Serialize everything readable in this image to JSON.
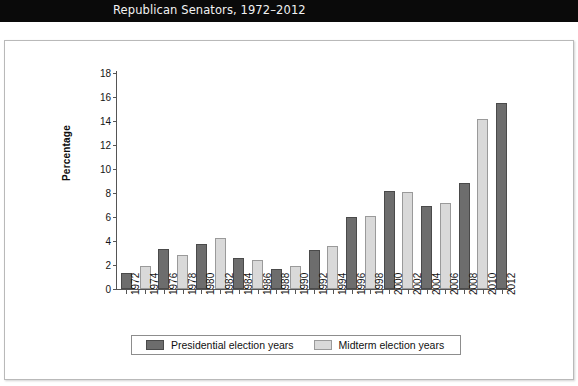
{
  "banner": {
    "title": "Republican Senators, 1972–2012"
  },
  "chart_data": {
    "type": "bar",
    "title": "Republican Senators, 1972–2012",
    "xlabel": "",
    "ylabel": "Percentage",
    "ylim": [
      0,
      18
    ],
    "ytick_values": [
      0,
      2,
      4,
      6,
      8,
      10,
      12,
      14,
      16,
      18
    ],
    "ytick_labels": [
      "0",
      "2",
      "4",
      "6",
      "8",
      "10",
      "12",
      "14",
      "16",
      "18"
    ],
    "grid": false,
    "legend_position": "below-plot",
    "categories": [
      "1972",
      "1974",
      "1976",
      "1978",
      "1980",
      "1982",
      "1984",
      "1986",
      "1988",
      "1990",
      "1992",
      "1994",
      "1996",
      "1998",
      "2000",
      "2002",
      "2004",
      "2006",
      "2008",
      "2010",
      "2012"
    ],
    "series": [
      {
        "name": "Presidential election years",
        "color": "#6d6d6d",
        "values": [
          1.35,
          null,
          3.3,
          null,
          3.75,
          null,
          2.55,
          null,
          1.65,
          null,
          3.25,
          null,
          6.0,
          null,
          8.2,
          null,
          6.9,
          null,
          8.8,
          null,
          15.5
        ]
      },
      {
        "name": "Midterm election years",
        "color": "#d9d9d9",
        "values": [
          null,
          1.9,
          null,
          2.8,
          null,
          4.25,
          null,
          2.45,
          null,
          1.95,
          null,
          3.6,
          null,
          6.1,
          null,
          8.1,
          null,
          7.2,
          null,
          14.2,
          null
        ]
      }
    ],
    "bars": [
      {
        "year": "1972",
        "value": 1.35,
        "series": "Presidential election years"
      },
      {
        "year": "1974",
        "value": 1.9,
        "series": "Midterm election years"
      },
      {
        "year": "1976",
        "value": 3.3,
        "series": "Presidential election years"
      },
      {
        "year": "1978",
        "value": 2.8,
        "series": "Midterm election years"
      },
      {
        "year": "1980",
        "value": 3.75,
        "series": "Presidential election years"
      },
      {
        "year": "1982",
        "value": 4.25,
        "series": "Midterm election years"
      },
      {
        "year": "1984",
        "value": 2.55,
        "series": "Presidential election years"
      },
      {
        "year": "1986",
        "value": 2.45,
        "series": "Midterm election years"
      },
      {
        "year": "1988",
        "value": 1.65,
        "series": "Presidential election years"
      },
      {
        "year": "1990",
        "value": 1.95,
        "series": "Midterm election years"
      },
      {
        "year": "1992",
        "value": 3.25,
        "series": "Presidential election years"
      },
      {
        "year": "1994",
        "value": 3.6,
        "series": "Midterm election years"
      },
      {
        "year": "1996",
        "value": 6.0,
        "series": "Presidential election years"
      },
      {
        "year": "1998",
        "value": 6.1,
        "series": "Midterm election years"
      },
      {
        "year": "2000",
        "value": 8.2,
        "series": "Presidential election years"
      },
      {
        "year": "2002",
        "value": 8.1,
        "series": "Midterm election years"
      },
      {
        "year": "2004",
        "value": 6.9,
        "series": "Presidential election years"
      },
      {
        "year": "2006",
        "value": 7.2,
        "series": "Midterm election years"
      },
      {
        "year": "2008",
        "value": 8.8,
        "series": "Presidential election years"
      },
      {
        "year": "2010",
        "value": 14.2,
        "series": "Midterm election years"
      },
      {
        "year": "2012",
        "value": 15.5,
        "series": "Presidential election years"
      }
    ]
  },
  "legend": {
    "items": [
      {
        "label": "Presidential election years",
        "key": "presidential"
      },
      {
        "label": "Midterm election years",
        "key": "midterm"
      }
    ]
  }
}
